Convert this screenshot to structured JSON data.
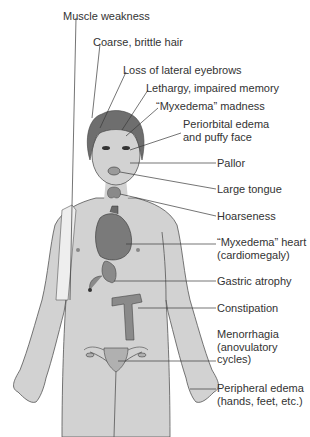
{
  "diagram": {
    "labels": [
      {
        "id": "muscle-weakness",
        "lines": [
          "Muscle weakness"
        ],
        "x": 63,
        "y": 10
      },
      {
        "id": "coarse-hair",
        "lines": [
          "Coarse, brittle hair"
        ],
        "x": 93,
        "y": 36
      },
      {
        "id": "lateral-eyebrows",
        "lines": [
          "Loss of lateral eyebrows"
        ],
        "x": 123,
        "y": 64
      },
      {
        "id": "lethargy",
        "lines": [
          "Lethargy, impaired memory"
        ],
        "x": 146,
        "y": 82
      },
      {
        "id": "myxedema-madness",
        "lines": [
          "“Myxedema” madness"
        ],
        "x": 156,
        "y": 100
      },
      {
        "id": "periorbital-edema",
        "lines": [
          "Periorbital edema",
          "and puffy face"
        ],
        "x": 183,
        "y": 118
      },
      {
        "id": "pallor",
        "lines": [
          "Pallor"
        ],
        "x": 217,
        "y": 157
      },
      {
        "id": "large-tongue",
        "lines": [
          "Large tongue"
        ],
        "x": 217,
        "y": 183
      },
      {
        "id": "hoarseness",
        "lines": [
          "Hoarseness"
        ],
        "x": 217,
        "y": 210
      },
      {
        "id": "myxedema-heart",
        "lines": [
          "“Myxedema” heart",
          "(cardiomegaly)"
        ],
        "x": 217,
        "y": 236
      },
      {
        "id": "gastric-atrophy",
        "lines": [
          "Gastric atrophy"
        ],
        "x": 217,
        "y": 275
      },
      {
        "id": "constipation",
        "lines": [
          "Constipation"
        ],
        "x": 217,
        "y": 302
      },
      {
        "id": "menorrhagia",
        "lines": [
          "Menorrhagia",
          "(anovulatory",
          "cycles)"
        ],
        "x": 217,
        "y": 328
      },
      {
        "id": "peripheral-edema",
        "lines": [
          "Peripheral edema",
          "(hands, feet, etc.)"
        ],
        "x": 217,
        "y": 382
      }
    ]
  },
  "colors": {
    "skin": "#d2d2d2",
    "skin_outline": "#555555",
    "hair": "#6e6e6e",
    "organ": "#8a8a8a",
    "organ_dark": "#5a5a5a",
    "leader_line": "#3a3a3a",
    "text": "#333333"
  }
}
